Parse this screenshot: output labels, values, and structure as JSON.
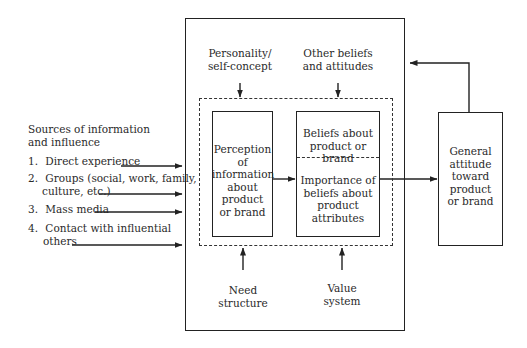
{
  "sources": {
    "title_line1": "Sources of information",
    "title_line2": "and influence",
    "items": [
      {
        "num": "1.",
        "line1": "Direct experience",
        "line2": ""
      },
      {
        "num": "2.",
        "line1": "Groups (social, work, family,",
        "line2": "culture, etc.)"
      },
      {
        "num": "3.",
        "line1": "Mass media",
        "line2": ""
      },
      {
        "num": "4.",
        "line1": "Contact with influential",
        "line2": "others"
      }
    ]
  },
  "top_influences": {
    "personality": {
      "line1": "Personality/",
      "line2": "self-concept"
    },
    "other_beliefs": {
      "line1": "Other beliefs",
      "line2": "and attitudes"
    }
  },
  "bottom_influences": {
    "need": {
      "line1": "Need",
      "line2": "structure"
    },
    "value": {
      "line1": "Value",
      "line2": "system"
    }
  },
  "perception_box": {
    "lines": [
      "Perception",
      "of",
      "information",
      "about",
      "product",
      "or brand"
    ]
  },
  "beliefs_box": {
    "upper_lines": [
      "Beliefs about",
      "product or brand"
    ],
    "lower_lines": [
      "Importance of",
      "beliefs about",
      "product",
      "attributes"
    ]
  },
  "attitude_box": {
    "lines": [
      "General",
      "attitude",
      "toward",
      "product",
      "or brand"
    ]
  },
  "colors": {
    "line": "#222222",
    "text": "#2a2a2a",
    "background": "#ffffff"
  }
}
